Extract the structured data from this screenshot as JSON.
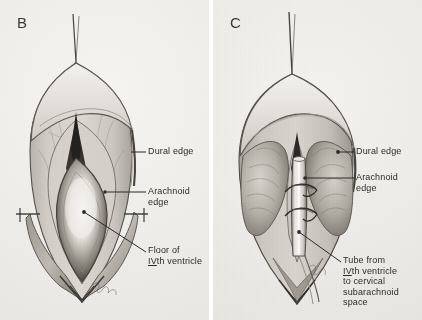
{
  "figure": {
    "background_color": "#f0eeea",
    "ink_color": "#2b2b2b"
  },
  "panels": [
    {
      "letter": "B",
      "caption": "Opened dura with arachnoid and floor of fourth ventricle exposed",
      "labels": [
        {
          "id": "dural-edge",
          "text": "Dural edge"
        },
        {
          "id": "arachnoid-edge",
          "text": "Arachnoid\nedge"
        },
        {
          "id": "floor-fourth-ventricle",
          "line1": "Floor of",
          "roman": "IV",
          "line2_suffix": "th ventricle"
        }
      ]
    },
    {
      "letter": "C",
      "caption": "Tube inserted from fourth ventricle to cervical subarachnoid space",
      "labels": [
        {
          "id": "dural-edge",
          "text": "Dural edge"
        },
        {
          "id": "arachnoid-edge",
          "text": "Arachnoid\nedge"
        },
        {
          "id": "tube-from-fourth-ventricle",
          "line1": "Tube from",
          "roman": "IV",
          "line2_suffix": "th ventricle",
          "line3": "to cervical",
          "line4": "subarachnoid",
          "line5": "space"
        }
      ]
    }
  ],
  "signature": {
    "present": true,
    "note": "artist cursive signature"
  }
}
